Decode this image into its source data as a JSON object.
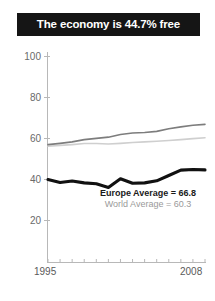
{
  "title": {
    "text": "The economy is 44.7% free"
  },
  "annotations": {
    "europe": "Europe Average = 66.8",
    "world": "World Average = 60.3"
  },
  "axis": {
    "y_ticks": [
      "20",
      "40",
      "60",
      "80",
      "100"
    ],
    "x_start_label": "1995",
    "x_end_label": "2008"
  },
  "colors": {
    "banner_bg": "#151515",
    "banner_text": "#ffffff",
    "country_line": "#111111",
    "europe_line": "#7d7d7d",
    "world_line": "#cfcfcf",
    "axis": "#b8b8b8",
    "tick_text": "#6a6a6a"
  },
  "chart_data": {
    "type": "line",
    "title": "The economy is 44.7% free",
    "xlabel": "",
    "ylabel": "",
    "xlim": [
      1995,
      2008
    ],
    "ylim": [
      0,
      100
    ],
    "grid": false,
    "legend_position": "inline-annotation",
    "x": [
      1995,
      1996,
      1997,
      1998,
      1999,
      2000,
      2001,
      2002,
      2003,
      2004,
      2005,
      2006,
      2007,
      2008
    ],
    "series": [
      {
        "name": "Country",
        "color": "#111111",
        "values": [
          40.0,
          38.6,
          39.3,
          38.4,
          38.0,
          36.2,
          40.4,
          38.2,
          38.4,
          39.4,
          42.0,
          44.6,
          44.9,
          44.7
        ]
      },
      {
        "name": "Europe Average",
        "color": "#7d7d7d",
        "final_value": 66.8,
        "values": [
          57.0,
          57.6,
          58.3,
          59.4,
          60.0,
          60.6,
          61.9,
          62.6,
          62.9,
          63.4,
          64.7,
          65.6,
          66.4,
          66.8
        ]
      },
      {
        "name": "World Average",
        "color": "#cfcfcf",
        "final_value": 60.3,
        "values": [
          56.2,
          56.6,
          57.0,
          57.5,
          57.5,
          57.3,
          57.6,
          58.0,
          58.3,
          58.6,
          59.0,
          59.4,
          59.9,
          60.3
        ]
      }
    ],
    "annotations": [
      {
        "text": "Europe Average = 66.8",
        "series": "Europe Average"
      },
      {
        "text": "World Average = 60.3",
        "series": "World Average"
      }
    ]
  }
}
